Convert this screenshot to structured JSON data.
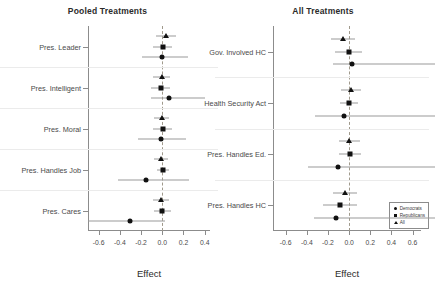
{
  "figure": {
    "panels": [
      {
        "id": "pooled",
        "title": "Pooled Treatments",
        "xlabel": "Effect",
        "xlim": [
          -0.7,
          0.45
        ],
        "xticks": [
          -0.6,
          -0.4,
          -0.2,
          0.0,
          0.2,
          0.4
        ],
        "xticklabels": [
          "-0.6",
          "-0.4",
          "-0.2",
          "0.0",
          "0.2",
          "0.4"
        ],
        "zero_reference": 0.0,
        "categories": [
          "Pres. Leader",
          "Pres. Intelligent",
          "Pres. Moral",
          "Pres. Handles Job",
          "Pres. Cares"
        ]
      },
      {
        "id": "all",
        "title": "All Treatments",
        "xlabel": "Effect",
        "xlim": [
          -0.72,
          0.68
        ],
        "xticks": [
          -0.6,
          -0.4,
          -0.2,
          0.0,
          0.2,
          0.4,
          0.6
        ],
        "xticklabels": [
          "-0.6",
          "-0.4",
          "-0.2",
          "0.0",
          "0.2",
          "0.4",
          "0.6"
        ],
        "zero_reference": 0.0,
        "categories": [
          "Gov. Involved HC",
          "Health Security Act",
          "Pres. Handles Ed.",
          "Pres. Handles HC"
        ]
      }
    ],
    "legend": {
      "position": "bottom-right-of-right-panel",
      "entries": [
        {
          "label": "Democrats",
          "marker": "circle"
        },
        {
          "label": "Republicans",
          "marker": "square"
        },
        {
          "label": "All",
          "marker": "triangle"
        }
      ]
    }
  },
  "chart_data": [
    {
      "type": "scatter",
      "subtype": "coefficient-plot-with-error-bars",
      "title": "Pooled Treatments",
      "xlabel": "Effect",
      "ylabel": "",
      "xlim": [
        -0.7,
        0.45
      ],
      "xticks": [
        -0.6,
        -0.4,
        -0.2,
        0.0,
        0.2,
        0.4
      ],
      "grid": false,
      "legend_position": "none",
      "reference_line": 0.0,
      "categories": [
        "Pres. Leader",
        "Pres. Intelligent",
        "Pres. Moral",
        "Pres. Handles Job",
        "Pres. Cares"
      ],
      "series": [
        {
          "name": "All",
          "marker": "triangle",
          "values": [
            0.035,
            -0.005,
            -0.005,
            -0.012,
            -0.015
          ],
          "ci_low": [
            -0.055,
            -0.085,
            -0.075,
            -0.075,
            -0.09
          ],
          "ci_high": [
            0.125,
            0.075,
            0.065,
            0.05,
            0.06
          ]
        },
        {
          "name": "Republicans",
          "marker": "square",
          "values": [
            0.005,
            -0.015,
            0.005,
            0.01,
            0.0
          ],
          "ci_low": [
            -0.085,
            -0.105,
            -0.085,
            -0.045,
            -0.08
          ],
          "ci_high": [
            0.095,
            0.075,
            0.095,
            0.065,
            0.08
          ]
        },
        {
          "name": "Democrats",
          "marker": "circle",
          "values": [
            0.0,
            0.06,
            -0.01,
            -0.155,
            -0.305
          ],
          "ci_low": [
            -0.19,
            -0.105,
            -0.23,
            -0.415,
            -0.7
          ],
          "ci_high": [
            0.24,
            0.4,
            0.22,
            0.25,
            0.03
          ]
        }
      ]
    },
    {
      "type": "scatter",
      "subtype": "coefficient-plot-with-error-bars",
      "title": "All Treatments",
      "xlabel": "Effect",
      "ylabel": "",
      "xlim": [
        -0.72,
        0.68
      ],
      "xticks": [
        -0.6,
        -0.4,
        -0.2,
        0.0,
        0.2,
        0.4,
        0.6
      ],
      "grid": false,
      "legend_position": "lower right",
      "reference_line": 0.0,
      "categories": [
        "Gov. Involved HC",
        "Health Security Act",
        "Pres. Handles Ed.",
        "Pres. Handles HC"
      ],
      "series": [
        {
          "name": "All",
          "marker": "triangle",
          "values": [
            -0.055,
            0.02,
            0.0,
            -0.04
          ],
          "ci_low": [
            -0.17,
            -0.075,
            -0.1,
            -0.155
          ],
          "ci_high": [
            0.06,
            0.115,
            0.1,
            0.075
          ]
        },
        {
          "name": "Republicans",
          "marker": "square",
          "values": [
            -0.005,
            0.0,
            0.005,
            -0.085
          ],
          "ci_low": [
            -0.135,
            -0.085,
            -0.1,
            -0.245
          ],
          "ci_high": [
            0.125,
            0.085,
            0.11,
            0.075
          ]
        },
        {
          "name": "Democrats",
          "marker": "circle",
          "values": [
            0.03,
            -0.045,
            -0.105,
            -0.12
          ],
          "ci_low": [
            -0.155,
            -0.32,
            -0.385,
            -0.33
          ]
        }
      ]
    }
  ]
}
